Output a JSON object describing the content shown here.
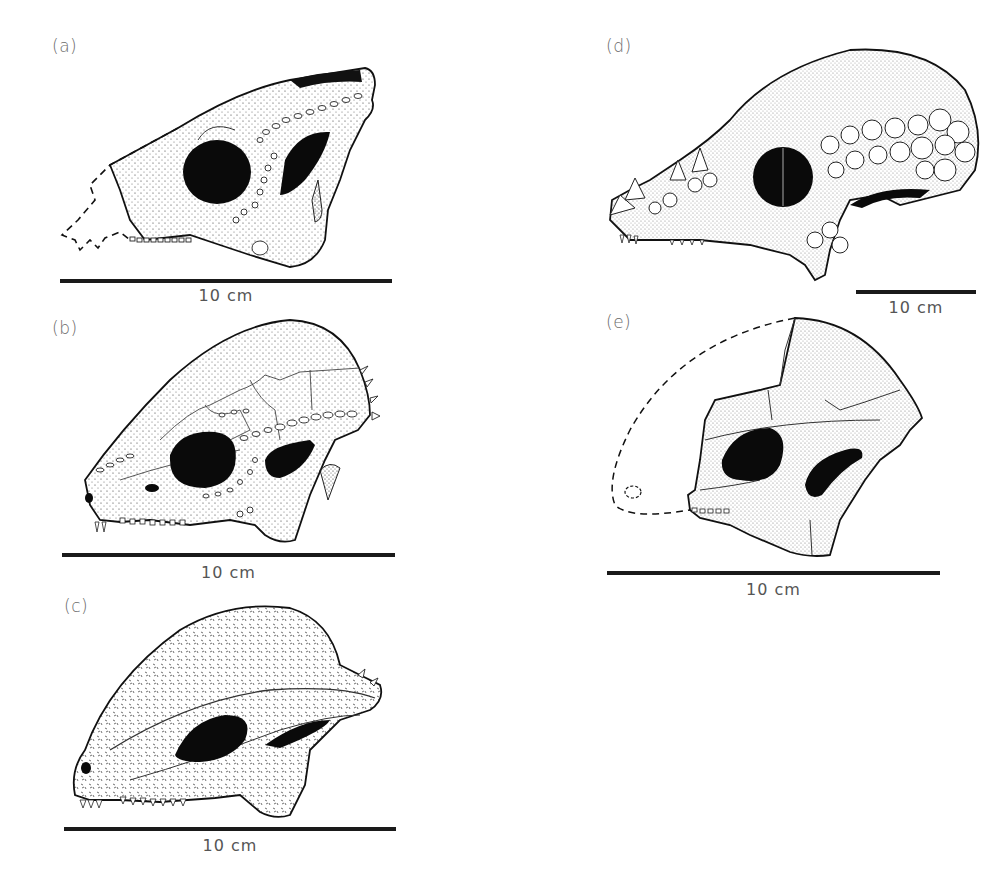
{
  "figure": {
    "panels": [
      {
        "id": "a",
        "label": "(a)",
        "scale_label": "10 cm"
      },
      {
        "id": "b",
        "label": "(b)",
        "scale_label": "10 cm"
      },
      {
        "id": "c",
        "label": "(c)",
        "scale_label": "10 cm"
      },
      {
        "id": "d",
        "label": "(d)",
        "scale_label": "10 cm"
      },
      {
        "id": "e",
        "label": "(e)",
        "scale_label": "10 cm"
      }
    ]
  },
  "colors": {
    "ink": "#1a1a1a",
    "bone": "#ffffff",
    "label": "#6a6a6a"
  }
}
